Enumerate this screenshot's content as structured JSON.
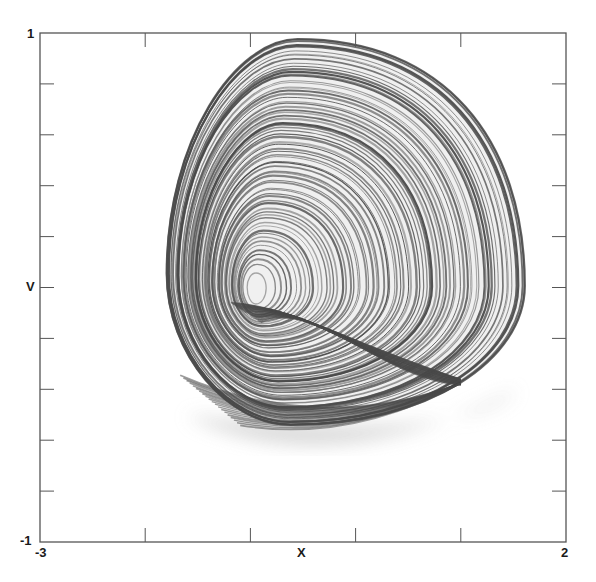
{
  "chart_data": {
    "type": "line",
    "subtype": "phase-portrait (strange attractor trajectory)",
    "title": "",
    "xlabel": "X",
    "ylabel": "V",
    "xlim": [
      -3,
      2
    ],
    "ylim": [
      -1,
      1
    ],
    "x_tick_labels": [
      "-3",
      "2"
    ],
    "y_tick_labels": [
      "-1",
      "1"
    ],
    "x_ticks": [
      -3,
      -2,
      -1,
      0,
      1,
      2
    ],
    "y_ticks": [
      -1,
      -0.8,
      -0.6,
      -0.4,
      -0.2,
      0,
      0.2,
      0.4,
      0.6,
      0.8,
      1
    ],
    "grid": false,
    "legend": null,
    "ticks_on_all_sides": true,
    "series": [
      {
        "name": "trajectory",
        "color": "#555555",
        "description": "Chaotic spiral trajectory winding around a focus near (X=-0.95, V=0.0), bounded roughly X in [-2.0, 1.4], V in [-0.62, 0.94], with a folded sheet at lower right near (X=1.0, V=-0.36)",
        "focus": {
          "x": -0.95,
          "y": 0.0
        },
        "extent": {
          "xmin": -2.0,
          "xmax": 1.45,
          "ymin": -0.62,
          "ymax": 0.94
        },
        "fold_point": {
          "x": 1.0,
          "y": -0.36
        }
      }
    ]
  },
  "colors": {
    "frame": "#555555",
    "trajectory_dark": "#4a4a4a",
    "trajectory_mid": "#777777",
    "shadow": "#d4d4d4",
    "text": "#1a1a1a"
  }
}
